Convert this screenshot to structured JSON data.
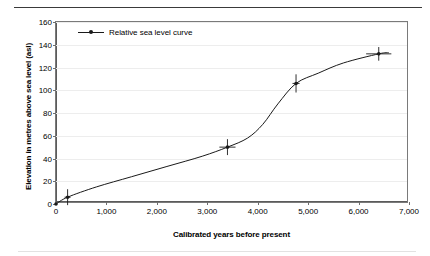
{
  "figure": {
    "top_rule": "horizontal-rule",
    "bottom_rule": "horizontal-rule"
  },
  "legend": {
    "position": "top-left-inside",
    "entries": [
      {
        "label": "Relative sea level curve",
        "marker": "line-with-dot",
        "color": "#1a1a1a"
      }
    ]
  },
  "axes": {
    "x": {
      "title": "Calibrated years before present",
      "ticks": [
        "0",
        "1,000",
        "2,000",
        "3,000",
        "4,000",
        "5,000",
        "6,000",
        "7,000"
      ],
      "values": [
        0,
        1000,
        2000,
        3000,
        4000,
        5000,
        6000,
        7000
      ],
      "min": 0,
      "max": 7000,
      "step": 1000
    },
    "y": {
      "title": "Elevation in metres above sea level (asl)",
      "ticks": [
        "0",
        "20",
        "40",
        "60",
        "80",
        "100",
        "120",
        "140",
        "160"
      ],
      "values": [
        0,
        20,
        40,
        60,
        80,
        100,
        120,
        140,
        160
      ],
      "min": 0,
      "max": 160,
      "step": 20
    }
  },
  "chart_data": {
    "type": "line",
    "title": "",
    "subtitle": "",
    "xlabel": "Calibrated years before present",
    "ylabel": "Elevation in metres above sea level (asl)",
    "xlim": [
      0,
      7000
    ],
    "ylim": [
      0,
      160
    ],
    "grid": "horizontal-only",
    "legend_position": "top-left-inside",
    "series": [
      {
        "name": "Relative sea level curve",
        "color": "#1a1a1a",
        "marker": "plus-dot",
        "points": [
          {
            "x": 0,
            "y": 0,
            "xerr": 0,
            "yerr": 0
          },
          {
            "x": 230,
            "y": 6,
            "xerr": 60,
            "yerr": 7
          },
          {
            "x": 3400,
            "y": 50,
            "xerr": 160,
            "yerr": 7
          },
          {
            "x": 4760,
            "y": 106,
            "xerr": 70,
            "yerr": 8
          },
          {
            "x": 6400,
            "y": 132,
            "xerr": 250,
            "yerr": 6
          }
        ],
        "curve": [
          {
            "x": 0,
            "y": 0
          },
          {
            "x": 230,
            "y": 6
          },
          {
            "x": 800,
            "y": 15
          },
          {
            "x": 1500,
            "y": 24
          },
          {
            "x": 2200,
            "y": 33
          },
          {
            "x": 2900,
            "y": 42
          },
          {
            "x": 3400,
            "y": 50
          },
          {
            "x": 3800,
            "y": 58
          },
          {
            "x": 4100,
            "y": 70
          },
          {
            "x": 4400,
            "y": 88
          },
          {
            "x": 4760,
            "y": 106
          },
          {
            "x": 5200,
            "y": 115
          },
          {
            "x": 5700,
            "y": 124
          },
          {
            "x": 6400,
            "y": 132
          },
          {
            "x": 6600,
            "y": 133
          }
        ]
      }
    ]
  }
}
